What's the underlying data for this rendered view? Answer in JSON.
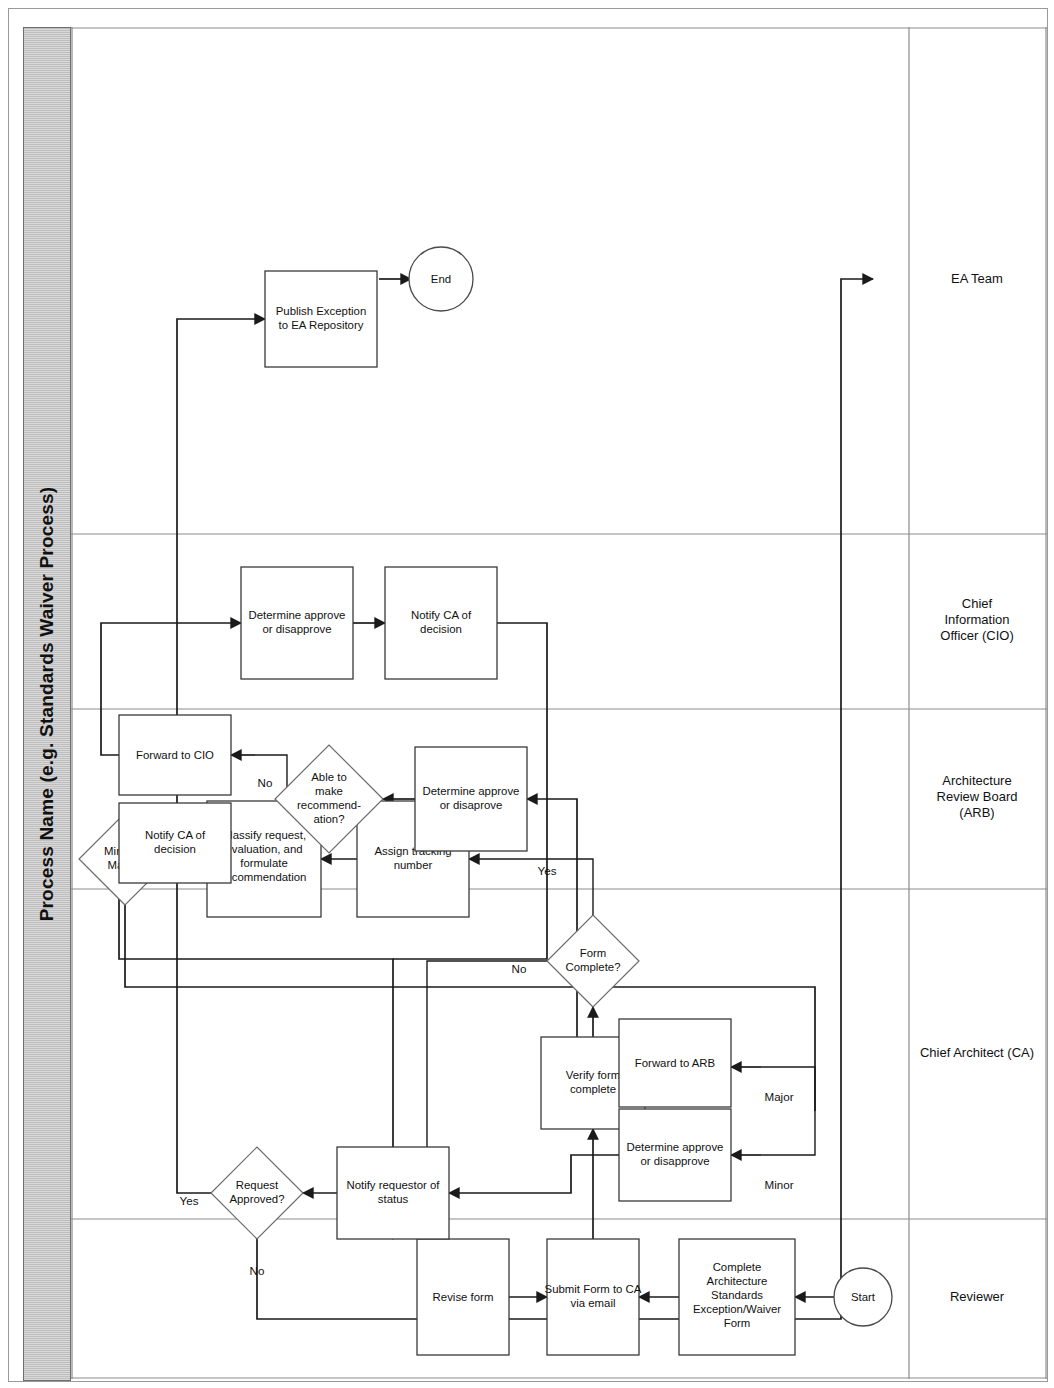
{
  "title": "Process Name (e.g. Standards Waiver Process)",
  "lanes": [
    {
      "id": "reviewer",
      "label": "Reviewer",
      "lines": [
        "Reviewer"
      ]
    },
    {
      "id": "ca",
      "label": "Chief Architect (CA)",
      "lines": [
        "Chief Architect (CA)"
      ]
    },
    {
      "id": "arb",
      "label": "Architecture Review Board (ARB)",
      "lines": [
        "Architecture",
        "Review Board",
        "(ARB)"
      ]
    },
    {
      "id": "cio",
      "label": "Chief Information Officer (CIO)",
      "lines": [
        "Chief",
        "Information",
        "Officer (CIO)"
      ]
    },
    {
      "id": "ea",
      "label": "EA Team",
      "lines": [
        "EA Team"
      ]
    }
  ],
  "nodes": [
    {
      "id": "start",
      "lane": "reviewer",
      "shape": "circle",
      "label": "Start",
      "lines": [
        "Start"
      ]
    },
    {
      "id": "complete-form",
      "lane": "reviewer",
      "shape": "process",
      "label": "Complete Architecture Standards Exception/Waiver Form",
      "lines": [
        "Complete",
        "Architecture",
        "Standards",
        "Exception/Waiver",
        "Form"
      ]
    },
    {
      "id": "submit-form",
      "lane": "reviewer",
      "shape": "process",
      "label": "Submit Form to CA via email",
      "lines": [
        "Submit Form to CA",
        "via email"
      ]
    },
    {
      "id": "revise-form",
      "lane": "reviewer",
      "shape": "process",
      "label": "Revise form",
      "lines": [
        "Revise form"
      ]
    },
    {
      "id": "verify-form",
      "lane": "ca",
      "shape": "process",
      "label": "Verify form complete",
      "lines": [
        "Verify form",
        "complete"
      ]
    },
    {
      "id": "form-complete",
      "lane": "ca",
      "shape": "decision",
      "label": "Form Complete?",
      "lines": [
        "Form",
        "Complete?"
      ]
    },
    {
      "id": "assign-tracking",
      "lane": "ca",
      "shape": "process",
      "label": "Assign tracking number",
      "lines": [
        "Assign tracking",
        "number"
      ]
    },
    {
      "id": "classify-request",
      "lane": "ca",
      "shape": "process",
      "label": "Classify request, evaluation, and formulate recommendation",
      "lines": [
        "Classify request,",
        "evaluation, and",
        "formulate",
        "recommendation"
      ]
    },
    {
      "id": "minor-or-major",
      "lane": "ca",
      "shape": "decision",
      "label": "Minor or Major?",
      "lines": [
        "Minor or",
        "Major?"
      ]
    },
    {
      "id": "ca-determine",
      "lane": "ca",
      "shape": "process",
      "label": "Determine approve or disapprove",
      "lines": [
        "Determine approve",
        "or disapprove"
      ]
    },
    {
      "id": "forward-to-arb",
      "lane": "ca",
      "shape": "process",
      "label": "Forward to ARB",
      "lines": [
        "Forward to ARB"
      ]
    },
    {
      "id": "notify-requestor",
      "lane": "ca",
      "shape": "process",
      "label": "Notify requestor of status",
      "lines": [
        "Notify requestor of",
        "status"
      ]
    },
    {
      "id": "request-approved",
      "lane": "ca",
      "shape": "decision",
      "label": "Request Approved?",
      "lines": [
        "Request",
        "Approved?"
      ]
    },
    {
      "id": "arb-determine",
      "lane": "arb",
      "shape": "process",
      "label": "Determine approve or disaprove",
      "lines": [
        "Determine approve",
        "or disaprove"
      ]
    },
    {
      "id": "able-to-recommend",
      "lane": "arb",
      "shape": "decision",
      "label": "Able to make recommend-ation?",
      "lines": [
        "Able to",
        "make",
        "recommend-",
        "ation?"
      ]
    },
    {
      "id": "arb-notify-ca",
      "lane": "arb",
      "shape": "process",
      "label": "Notify CA of decision",
      "lines": [
        "Notify CA of",
        "decision"
      ]
    },
    {
      "id": "forward-to-cio",
      "lane": "arb",
      "shape": "process",
      "label": "Forward to CIO",
      "lines": [
        "Forward to CIO"
      ]
    },
    {
      "id": "cio-determine",
      "lane": "cio",
      "shape": "process",
      "label": "Determine approve or disapprove",
      "lines": [
        "Determine approve",
        "or disapprove"
      ]
    },
    {
      "id": "cio-notify-ca",
      "lane": "cio",
      "shape": "process",
      "label": "Notify CA of decision",
      "lines": [
        "Notify CA of",
        "decision"
      ]
    },
    {
      "id": "publish-exception",
      "lane": "ea",
      "shape": "process",
      "label": "Publish Exception to EA Repository",
      "lines": [
        "Publish Exception",
        "to EA Repository"
      ]
    },
    {
      "id": "end",
      "lane": "ea",
      "shape": "circle",
      "label": "End",
      "lines": [
        "End"
      ]
    }
  ],
  "edge_labels": {
    "form_complete_no": "No",
    "form_complete_yes": "Yes",
    "minor": "Minor",
    "major": "Major",
    "able_yes": "Yes",
    "able_no": "No",
    "approved_yes": "Yes",
    "approved_no": "No"
  },
  "colors": {
    "title_bar": "#c9c9c9",
    "node_fill": "#ffffff",
    "node_stroke": "#3a3a3a",
    "edge": "#1a1a1a",
    "lane_divider": "#8c8c8c"
  }
}
